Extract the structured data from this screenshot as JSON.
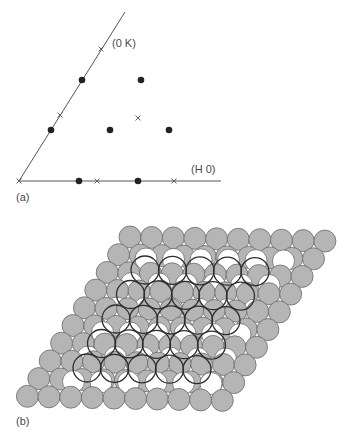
{
  "panel_a": {
    "label": "(a)",
    "label_pos": [
      16,
      201
    ],
    "axis_origin": [
      19,
      181
    ],
    "axis_h_end": [
      221,
      181
    ],
    "axis_k_end": [
      125,
      12
    ],
    "axis_h_label": "(H 0)",
    "axis_h_label_pos": [
      191,
      173
    ],
    "axis_k_label": "(0 K)",
    "axis_k_label_pos": [
      112,
      47
    ],
    "dots": [
      [
        82,
        80
      ],
      [
        141,
        80
      ],
      [
        51,
        130
      ],
      [
        110,
        130
      ],
      [
        169,
        130
      ],
      [
        79,
        181
      ],
      [
        138,
        181
      ]
    ],
    "crosses": [
      [
        19,
        181
      ],
      [
        101,
        49
      ],
      [
        60,
        115
      ],
      [
        138,
        118
      ],
      [
        97,
        181
      ],
      [
        174,
        181
      ]
    ],
    "colors": {
      "line": "#555555",
      "dot": "#222222",
      "cross": "#555555"
    }
  },
  "panel_b": {
    "label": "(b)",
    "label_pos": [
      16,
      425
    ],
    "substrate": {
      "origin": [
        130,
        237
      ],
      "a": [
        21.65,
        0.45
      ],
      "b": [
        -11.4,
        17.7
      ],
      "rows": 10,
      "cols": 10,
      "radius": 11,
      "fill": "#b5b5b5",
      "stroke": "#6a6a6a"
    },
    "overlayer": {
      "origin": [
        146,
        259
      ],
      "a": [
        27.5,
        0.4
      ],
      "b": [
        -14.5,
        24.5
      ],
      "rows": 6,
      "cols": 6,
      "radius": 11,
      "fill": "#ffffff",
      "stroke": "#6a6a6a"
    },
    "rings": {
      "origin": [
        145,
        270
      ],
      "a": [
        27.5,
        0.4
      ],
      "b": [
        -14.5,
        24.5
      ],
      "rows": 5,
      "cols": 5,
      "radius": 14,
      "stroke": "#2e2e2e"
    }
  }
}
